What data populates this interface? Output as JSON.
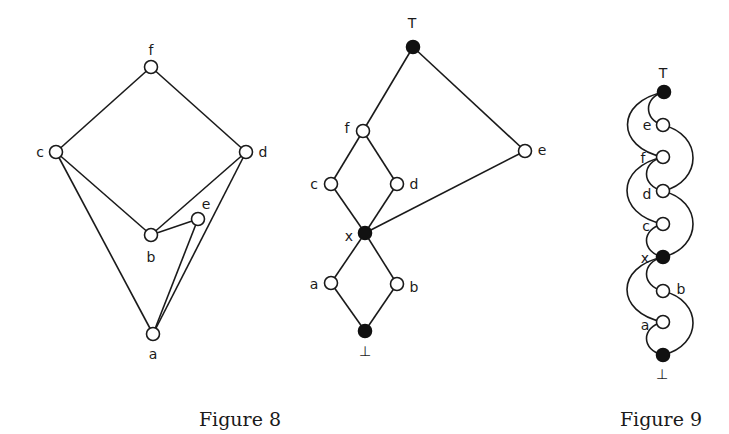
{
  "figures": [
    {
      "id": "fig8a",
      "nodes": [
        {
          "id": "f",
          "label": "f",
          "x": 151,
          "y": 67,
          "filled": false,
          "lx": 151,
          "ly": 50
        },
        {
          "id": "c",
          "label": "c",
          "x": 56,
          "y": 152,
          "filled": false,
          "lx": 40,
          "ly": 152
        },
        {
          "id": "d",
          "label": "d",
          "x": 246,
          "y": 152,
          "filled": false,
          "lx": 263,
          "ly": 152
        },
        {
          "id": "b",
          "label": "b",
          "x": 151,
          "y": 235,
          "filled": false,
          "lx": 151,
          "ly": 257
        },
        {
          "id": "e",
          "label": "e",
          "x": 198,
          "y": 219,
          "filled": false,
          "lx": 206,
          "ly": 204
        },
        {
          "id": "a",
          "label": "a",
          "x": 153,
          "y": 334,
          "filled": false,
          "lx": 153,
          "ly": 354
        }
      ],
      "edges": [
        [
          "f",
          "c"
        ],
        [
          "f",
          "d"
        ],
        [
          "c",
          "b"
        ],
        [
          "c",
          "a"
        ],
        [
          "d",
          "b"
        ],
        [
          "d",
          "a"
        ],
        [
          "b",
          "e"
        ],
        [
          "e",
          "a"
        ]
      ]
    },
    {
      "id": "fig8b",
      "nodes": [
        {
          "id": "top",
          "label": "T",
          "x": 413,
          "y": 47,
          "filled": true,
          "lx": 412,
          "ly": 23
        },
        {
          "id": "f",
          "label": "f",
          "x": 363,
          "y": 131,
          "filled": false,
          "lx": 347,
          "ly": 128
        },
        {
          "id": "e",
          "label": "e",
          "x": 525,
          "y": 151,
          "filled": false,
          "lx": 542,
          "ly": 150
        },
        {
          "id": "c",
          "label": "c",
          "x": 331,
          "y": 184,
          "filled": false,
          "lx": 314,
          "ly": 184
        },
        {
          "id": "d",
          "label": "d",
          "x": 397,
          "y": 184,
          "filled": false,
          "lx": 414,
          "ly": 184
        },
        {
          "id": "x",
          "label": "x",
          "x": 365,
          "y": 233,
          "filled": true,
          "lx": 349,
          "ly": 236
        },
        {
          "id": "a",
          "label": "a",
          "x": 331,
          "y": 283,
          "filled": false,
          "lx": 314,
          "ly": 284
        },
        {
          "id": "b",
          "label": "b",
          "x": 397,
          "y": 284,
          "filled": false,
          "lx": 414,
          "ly": 287
        },
        {
          "id": "bottom",
          "label": "⊥",
          "x": 365,
          "y": 331,
          "filled": true,
          "lx": 365,
          "ly": 351
        }
      ],
      "edges": [
        [
          "top",
          "f"
        ],
        [
          "top",
          "e"
        ],
        [
          "f",
          "c"
        ],
        [
          "f",
          "d"
        ],
        [
          "c",
          "x"
        ],
        [
          "d",
          "x"
        ],
        [
          "e",
          "x"
        ],
        [
          "x",
          "a"
        ],
        [
          "x",
          "b"
        ],
        [
          "a",
          "bottom"
        ],
        [
          "b",
          "bottom"
        ]
      ]
    },
    {
      "id": "fig9",
      "nodes": [
        {
          "id": "top",
          "label": "T",
          "x": 664,
          "y": 92,
          "filled": true,
          "lx": 663,
          "ly": 73
        },
        {
          "id": "e",
          "label": "e",
          "x": 663,
          "y": 125,
          "filled": false,
          "lx": 647,
          "ly": 125
        },
        {
          "id": "f",
          "label": "f",
          "x": 663,
          "y": 157,
          "filled": false,
          "lx": 643,
          "ly": 158
        },
        {
          "id": "d",
          "label": "d",
          "x": 663,
          "y": 191,
          "filled": false,
          "lx": 647,
          "ly": 194
        },
        {
          "id": "c",
          "label": "c",
          "x": 663,
          "y": 224,
          "filled": false,
          "lx": 646,
          "ly": 226
        },
        {
          "id": "x",
          "label": "x",
          "x": 663,
          "y": 257,
          "filled": true,
          "lx": 645,
          "ly": 258
        },
        {
          "id": "b",
          "label": "b",
          "x": 663,
          "y": 291,
          "filled": false,
          "lx": 681,
          "ly": 289
        },
        {
          "id": "a",
          "label": "a",
          "x": 663,
          "y": 322,
          "filled": false,
          "lx": 645,
          "ly": 325
        },
        {
          "id": "bottom",
          "label": "⊥",
          "x": 663,
          "y": 355,
          "filled": true,
          "lx": 662,
          "ly": 374
        }
      ],
      "arcs": [
        {
          "from": "top",
          "to": "e",
          "side": "left",
          "bulge": 10
        },
        {
          "from": "top",
          "to": "f",
          "side": "left",
          "bulge": 24
        },
        {
          "from": "e",
          "to": "d",
          "side": "right",
          "bulge": 20
        },
        {
          "from": "f",
          "to": "d",
          "side": "left",
          "bulge": 11
        },
        {
          "from": "f",
          "to": "c",
          "side": "left",
          "bulge": 24
        },
        {
          "from": "d",
          "to": "x",
          "side": "right",
          "bulge": 20
        },
        {
          "from": "c",
          "to": "x",
          "side": "left",
          "bulge": 11
        },
        {
          "from": "x",
          "to": "b",
          "side": "left",
          "bulge": 11
        },
        {
          "from": "x",
          "to": "a",
          "side": "left",
          "bulge": 24
        },
        {
          "from": "b",
          "to": "bottom",
          "side": "right",
          "bulge": 20
        },
        {
          "from": "a",
          "to": "bottom",
          "side": "left",
          "bulge": 11
        }
      ]
    }
  ],
  "captions": [
    {
      "text": "Figure 8",
      "x": 240,
      "y": 426
    },
    {
      "text": "Figure 9",
      "x": 661,
      "y": 426
    }
  ]
}
